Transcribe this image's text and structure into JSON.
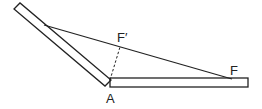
{
  "diagram": {
    "labels": {
      "f_prime": "F′",
      "a": "A",
      "f": "F"
    },
    "colors": {
      "stroke": "#222222",
      "background": "#ffffff"
    }
  }
}
